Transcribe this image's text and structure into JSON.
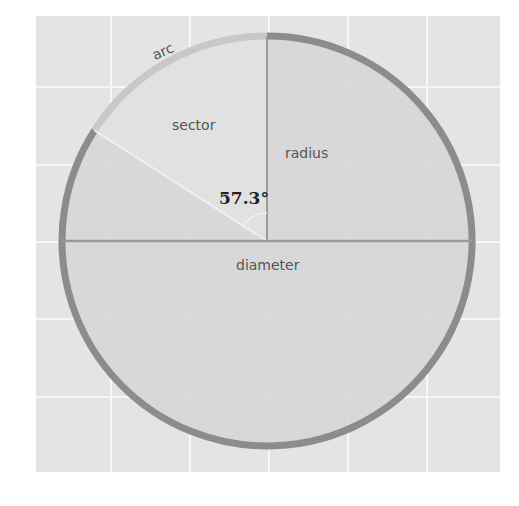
{
  "diagram": {
    "type": "circle-anatomy",
    "labels": {
      "arc": "arc",
      "sector": "sector",
      "radius": "radius",
      "diameter": "diameter",
      "angle": "57.3°"
    },
    "angle_degrees": 57.3,
    "colors": {
      "background": "#ffffff",
      "grid_fill": "#e4e4e4",
      "grid_lines": "#f7f7f7",
      "circle_fill": "#d6d6d6",
      "sector_fill": "#e0e0e0",
      "circle_stroke": "#8c8c8c",
      "arc_stroke": "#c8c8c8",
      "line_stroke": "#9a9a9a",
      "label_text": "#555555",
      "angle_text": "#222222"
    }
  }
}
